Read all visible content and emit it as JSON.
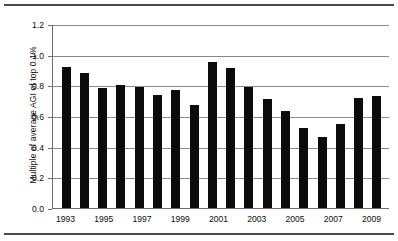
{
  "figure": {
    "frame_color": "#4a4a4a",
    "background": "#ffffff"
  },
  "chart_data": {
    "type": "bar",
    "title": "",
    "xlabel": "",
    "ylabel": "Multiple of average AGI of top 0.1%",
    "ylim": [
      0.0,
      1.2
    ],
    "ytick_labels": [
      "0.0",
      "0.2",
      "0.4",
      "0.6",
      "0.8",
      "1.0",
      "1.2"
    ],
    "ytick_values": [
      0.0,
      0.2,
      0.4,
      0.6,
      0.8,
      1.0,
      1.2
    ],
    "grid": true,
    "grid_axis": "y",
    "legend": false,
    "bar_color": "#0b0b0b",
    "categories": [
      "1993",
      "1994",
      "1995",
      "1996",
      "1997",
      "1998",
      "1999",
      "2000",
      "2001",
      "2002",
      "2003",
      "2004",
      "2005",
      "2006",
      "2007",
      "2008",
      "2009",
      "2010"
    ],
    "visible_tick_labels": [
      "1993",
      "",
      "1995",
      "",
      "1997",
      "",
      "1999",
      "",
      "2001",
      "",
      "2003",
      "",
      "2005",
      "",
      "2007",
      "",
      "2009",
      ""
    ],
    "values": [
      0.92,
      0.88,
      0.78,
      0.8,
      0.79,
      0.74,
      0.77,
      0.67,
      0.95,
      0.91,
      0.79,
      0.71,
      0.63,
      0.52,
      0.46,
      0.55,
      0.72,
      0.73
    ]
  }
}
